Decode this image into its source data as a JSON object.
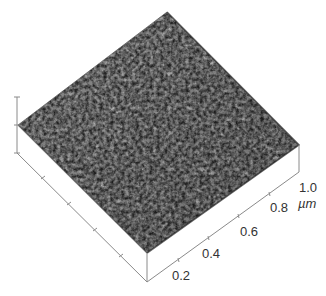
{
  "figure": {
    "type": "AFM 3D surface topography",
    "surface_color_base": "#7a7a7a",
    "surface_color_dark": "#3a3a3a",
    "surface_color_light": "#b0b0b0",
    "axis_color": "#8a8a8a",
    "x_axis": {
      "unit": "µm",
      "ticks": [
        "0.2",
        "0.4",
        "0.6",
        "0.8",
        "1.0"
      ]
    },
    "y_axis": {
      "ticks_count": 4
    },
    "z_axis": {
      "ticks_count": 2
    }
  }
}
